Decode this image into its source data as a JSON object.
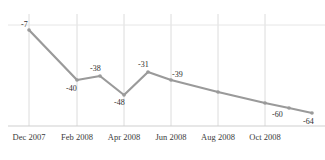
{
  "chart_data": {
    "type": "line",
    "title": "",
    "xlabel": "",
    "ylabel": "",
    "grid": true,
    "legend": false,
    "legend_position": "none",
    "line_color": "#9a9a9a",
    "gridline_color": "#dcdcdc",
    "axis_color": "#cfcfcf",
    "background_color": "#ffffff",
    "label_color": "#2e2e2e",
    "tick_label_color": "#3a3a3a",
    "ylim": [
      -70,
      0
    ],
    "categories": [
      "Dec 2007",
      "Jan 2008",
      "Feb 2008",
      "Mar 2008",
      "Apr 2008",
      "May 2008",
      "Jun 2008",
      "Sep 2008",
      "Oct 2008",
      "Nov 2008"
    ],
    "values": [
      -7,
      -40,
      -38,
      -48,
      -31,
      -39,
      -44,
      -53,
      -60,
      -64
    ],
    "point_labels": [
      "-7",
      "-40",
      "-38",
      "-48",
      "-31",
      "-39",
      "",
      "",
      "-60",
      "-64"
    ],
    "x_tick_labels": [
      "Dec 2007",
      "Feb 2008",
      "Apr 2008",
      "Jun 2008",
      "Aug 2008",
      "Oct 2008"
    ],
    "points_px": [
      {
        "x": 29,
        "y": 30,
        "label": "-7",
        "lx": 21,
        "ly": 20
      },
      {
        "x": 77,
        "y": 80,
        "label": "-40",
        "lx": 66,
        "ly": 84
      },
      {
        "x": 100,
        "y": 76,
        "label": "-38",
        "lx": 90,
        "ly": 64
      },
      {
        "x": 124,
        "y": 95,
        "label": "-48",
        "lx": 114,
        "ly": 98
      },
      {
        "x": 148,
        "y": 72,
        "label": "-31",
        "lx": 138,
        "ly": 60
      },
      {
        "x": 171,
        "y": 80,
        "label": "-39",
        "lx": 172,
        "ly": 70
      },
      {
        "x": 218,
        "y": 92,
        "label": "",
        "lx": 0,
        "ly": 0
      },
      {
        "x": 265,
        "y": 103,
        "label": "",
        "lx": 0,
        "ly": 0
      },
      {
        "x": 289,
        "y": 108,
        "label": "-60",
        "lx": 272,
        "ly": 110
      },
      {
        "x": 312,
        "y": 113,
        "label": "-64",
        "lx": 303,
        "ly": 117
      }
    ],
    "gridlines_x_px": [
      29,
      77,
      124,
      171,
      218,
      265
    ],
    "gridline_top_px": 14,
    "gridline_bottom_px": 126,
    "hline_y_px": 25,
    "baseline_y_px": 126,
    "x_tick_label_px": [
      29,
      77,
      124,
      171,
      218,
      265
    ]
  }
}
